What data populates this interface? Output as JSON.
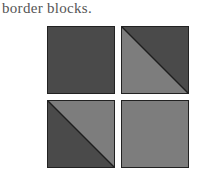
{
  "caption": "border blocks.",
  "colors": {
    "dark": "#4a4a4a",
    "light": "#7d7d7d",
    "line": "#1e1e1e"
  },
  "blocks": [
    {
      "name": "solid-dark",
      "type": "solid",
      "fill": "dark"
    },
    {
      "name": "diagonal-dark-upper-right",
      "type": "diagonal",
      "upper_right": "dark",
      "lower_left": "light"
    },
    {
      "name": "diagonal-light-upper-right",
      "type": "diagonal",
      "upper_right": "light",
      "lower_left": "dark"
    },
    {
      "name": "solid-light",
      "type": "solid",
      "fill": "light"
    }
  ]
}
